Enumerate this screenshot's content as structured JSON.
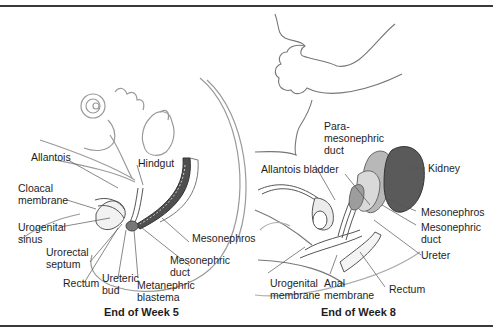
{
  "figure": {
    "panels": [
      {
        "id": "week5",
        "caption": "End of Week 5",
        "labels": {
          "allantois": "Allantois",
          "hindgut": "Hindgut",
          "cloacal_membrane_1": "Cloacal",
          "cloacal_membrane_2": "membrane",
          "urogenital_sinus_1": "Urogenital",
          "urogenital_sinus_2": "sinus",
          "urorectal_septum_1": "Urorectal",
          "urorectal_septum_2": "septum",
          "rectum": "Rectum",
          "ureteric_bud_1": "Ureteric",
          "ureteric_bud_2": "bud",
          "metanephric_blastema_1": "Metanephric",
          "metanephric_blastema_2": "blastema",
          "mesonephric_duct_1": "Mesonephric",
          "mesonephric_duct_2": "duct",
          "mesonephros": "Mesonephros"
        }
      },
      {
        "id": "week8",
        "caption": "End of Week 8",
        "labels": {
          "paramesonephric_duct_1": "Para-",
          "paramesonephric_duct_2": "mesonephric",
          "paramesonephric_duct_3": "duct",
          "allantois_bladder": "Allantois bladder",
          "kidney": "Kidney",
          "mesonephros": "Mesonephros",
          "mesonephric_duct_1": "Mesonephric",
          "mesonephric_duct_2": "duct",
          "ureter": "Ureter",
          "urogenital_membrane_1": "Urogenital",
          "urogenital_membrane_2": "membrane",
          "anal_membrane_1": "Anal",
          "anal_membrane_2": "membrane",
          "rectum": "Rectum"
        }
      }
    ],
    "colors": {
      "line": "#555555",
      "light_line": "#9a9a9a",
      "kidney": "#5a5a5a",
      "mesonephros": "#a8a8a8",
      "rule": "#3a3a3a"
    }
  }
}
